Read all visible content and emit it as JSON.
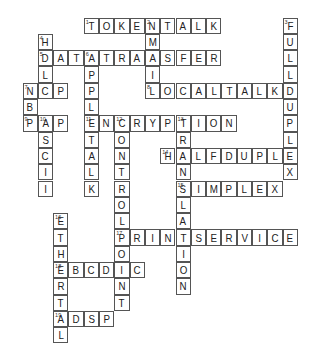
{
  "puzzle": {
    "grid": {
      "origin_x": 23,
      "origin_y": 18,
      "cell_w": 15.3,
      "cell_h": 16.3
    },
    "words": [
      {
        "num": 1,
        "answer": "TOKENTALK",
        "dir": "across",
        "row": 0,
        "col": 4
      },
      {
        "num": 2,
        "answer": "EMAIL",
        "dir": "down",
        "row": 0,
        "col": 8
      },
      {
        "num": 3,
        "answer": "FULLDUPLEX",
        "dir": "down",
        "row": 0,
        "col": 17
      },
      {
        "num": 4,
        "answer": "HDLC",
        "dir": "down",
        "row": 1,
        "col": 1
      },
      {
        "num": 5,
        "answer": "DATATRANSFER",
        "dir": "across",
        "row": 2,
        "col": 1
      },
      {
        "num": 6,
        "answer": "APPLETALK",
        "dir": "down",
        "row": 2,
        "col": 4
      },
      {
        "num": 7,
        "answer": "NCP",
        "dir": "across",
        "row": 4,
        "col": 0
      },
      {
        "num": 7,
        "answer": "NBP",
        "dir": "down",
        "row": 4,
        "col": 0
      },
      {
        "num": 8,
        "answer": "LOCALTALK",
        "dir": "across",
        "row": 4,
        "col": 8
      },
      {
        "num": 9,
        "answer": "PAP",
        "dir": "across",
        "row": 6,
        "col": 0
      },
      {
        "num": 10,
        "answer": "ASCII",
        "dir": "down",
        "row": 6,
        "col": 1
      },
      {
        "num": 11,
        "answer": "ENCRYPTION",
        "dir": "across",
        "row": 6,
        "col": 4
      },
      {
        "num": 12,
        "answer": "CONTROLPOINT",
        "dir": "down",
        "row": 6,
        "col": 6
      },
      {
        "num": 13,
        "answer": "TRANSLATION",
        "dir": "down",
        "row": 6,
        "col": 10
      },
      {
        "num": 14,
        "answer": "HALFDUPLE",
        "dir": "across",
        "row": 8,
        "col": 9
      },
      {
        "num": 15,
        "answer": "SIMPLEX",
        "dir": "across",
        "row": 10,
        "col": 10
      },
      {
        "num": 16,
        "answer": "ETHERTAL",
        "dir": "down",
        "row": 12,
        "col": 2
      },
      {
        "num": 17,
        "answer": "PRINTSERVICE",
        "dir": "across",
        "row": 13,
        "col": 6
      },
      {
        "num": 18,
        "answer": "EBCDIC",
        "dir": "across",
        "row": 15,
        "col": 2
      },
      {
        "num": 19,
        "answer": "ADSP",
        "dir": "across",
        "row": 18,
        "col": 2
      }
    ]
  }
}
